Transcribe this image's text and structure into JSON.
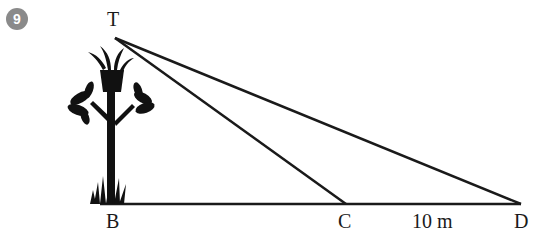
{
  "question_number": "9",
  "labels": {
    "T": "T",
    "B": "B",
    "C": "C",
    "D": "D",
    "distance_CD": "10 m"
  },
  "points": {
    "T": [
      115,
      38
    ],
    "B": [
      103,
      204
    ],
    "C": [
      346,
      204
    ],
    "D": [
      521,
      204
    ]
  },
  "colors": {
    "line": "#1a1a1a",
    "badge": "#8a8a8a"
  }
}
